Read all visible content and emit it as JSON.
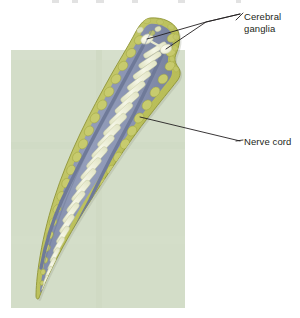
{
  "figure": {
    "title_visible": false,
    "background_color": "#ffffff",
    "panel": {
      "name": "specimen-background-panel",
      "color": "#d3ddc8",
      "x": 11,
      "y": 50,
      "width": 174,
      "height": 258
    },
    "organism": {
      "name": "planarian-body",
      "body_fill": "#8f99b5",
      "margin_fill": "#c5c96a",
      "margin_stroke": "#9aa23f",
      "rung_fill": "#eef0d8",
      "ganglion_fill": "#f4f3e2",
      "head_top_y": 17,
      "tail_tip_x": 40,
      "tail_tip_y": 298
    },
    "ladder_rungs": 26,
    "ganglia_count": 2
  },
  "labels": [
    {
      "id": "cerebral-ganglia",
      "line1": "Cerebral",
      "line2": "ganglia",
      "text_color": "#231f20",
      "x": 244,
      "y": 11,
      "leader_count": 2
    },
    {
      "id": "nerve-cord",
      "line1": "Nerve cord",
      "line2": "",
      "text_color": "#231f20",
      "x": 244,
      "y": 136,
      "leader_count": 1
    }
  ],
  "leader_lines": {
    "color": "#231f20",
    "width": 0.9
  }
}
